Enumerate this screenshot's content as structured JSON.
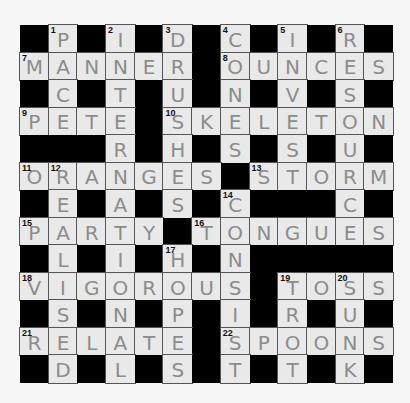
{
  "puzzle": {
    "type": "crossword",
    "rows": 13,
    "cols": 13,
    "colors": {
      "block": "#000000",
      "cell": "#e9e9e9",
      "pencil": "#8c8c8c"
    },
    "grid": [
      "#P#I#D#C#I#R#",
      "MANNER#OUNCES",
      "#C#T#U#N#V#S#",
      "PETE#SKELETON",
      "###R#H#S#S#U#",
      "ORANGES#STORM",
      "#E#A#S#C###C#",
      "PARTY#TONGUES",
      "#L#I#H#N#####",
      "VIGOROUS#TOSS",
      "#S#N#P#I#R#U#",
      "RELATE#SPOONS",
      "#D#L#S#T#T#K#"
    ],
    "numbers": [
      {
        "n": "1",
        "r": 0,
        "c": 1
      },
      {
        "n": "2",
        "r": 0,
        "c": 3
      },
      {
        "n": "3",
        "r": 0,
        "c": 5
      },
      {
        "n": "4",
        "r": 0,
        "c": 7
      },
      {
        "n": "5",
        "r": 0,
        "c": 9
      },
      {
        "n": "6",
        "r": 0,
        "c": 11
      },
      {
        "n": "7",
        "r": 1,
        "c": 0
      },
      {
        "n": "8",
        "r": 1,
        "c": 7
      },
      {
        "n": "9",
        "r": 3,
        "c": 0
      },
      {
        "n": "10",
        "r": 3,
        "c": 5
      },
      {
        "n": "11",
        "r": 5,
        "c": 0
      },
      {
        "n": "12",
        "r": 5,
        "c": 1
      },
      {
        "n": "13",
        "r": 5,
        "c": 8
      },
      {
        "n": "14",
        "r": 6,
        "c": 7
      },
      {
        "n": "15",
        "r": 7,
        "c": 0
      },
      {
        "n": "16",
        "r": 7,
        "c": 6
      },
      {
        "n": "17",
        "r": 8,
        "c": 5
      },
      {
        "n": "18",
        "r": 9,
        "c": 0
      },
      {
        "n": "19",
        "r": 9,
        "c": 9
      },
      {
        "n": "20",
        "r": 9,
        "c": 11
      },
      {
        "n": "21",
        "r": 11,
        "c": 0
      },
      {
        "n": "22",
        "r": 11,
        "c": 7
      }
    ],
    "across": [
      {
        "n": "7",
        "answer": "MANNER"
      },
      {
        "n": "8",
        "answer": "OUNCES"
      },
      {
        "n": "9",
        "answer": "PETE"
      },
      {
        "n": "10",
        "answer": "SKELETON"
      },
      {
        "n": "11",
        "answer": "ORANGES"
      },
      {
        "n": "13",
        "answer": "STORM"
      },
      {
        "n": "15",
        "answer": "PARTY"
      },
      {
        "n": "16",
        "answer": "TONGUES"
      },
      {
        "n": "18",
        "answer": "VIGOROUS"
      },
      {
        "n": "19",
        "answer": "TOSS"
      },
      {
        "n": "21",
        "answer": "RELATE"
      },
      {
        "n": "22",
        "answer": "SPOONS"
      }
    ],
    "down": [
      {
        "n": "1",
        "answer": "PACE"
      },
      {
        "n": "2",
        "answer": "INTERN"
      },
      {
        "n": "3",
        "answer": "DRUSHES"
      },
      {
        "n": "4",
        "answer": "CONKERS"
      },
      {
        "n": "5",
        "answer": "IVES"
      },
      {
        "n": "6",
        "answer": "RESOURCE"
      },
      {
        "n": "12",
        "answer": "REALISED"
      },
      {
        "n": "14",
        "answer": "CONSIST"
      },
      {
        "n": "17",
        "answer": "HOPES"
      },
      {
        "n": "19",
        "answer": "TRT"
      },
      {
        "n": "20",
        "answer": "SUNK"
      }
    ]
  }
}
